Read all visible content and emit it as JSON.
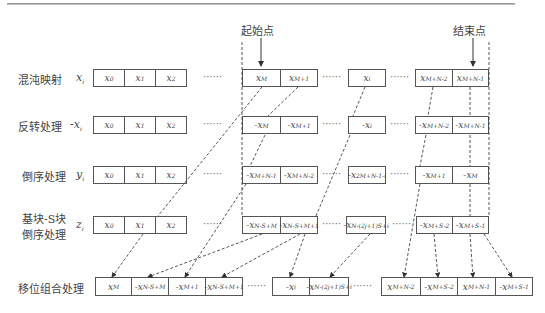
{
  "markers": {
    "start": "起始点",
    "end": "结束点"
  },
  "rows": [
    {
      "label": "混沌映射",
      "var": "x",
      "left": [
        "x₀",
        "x₁",
        "x₂"
      ],
      "right": [
        "x_M",
        "x_M+1",
        "x_i",
        "x_M+N-2",
        "x_M+N-1"
      ]
    },
    {
      "label": "反转处理",
      "var": "-x",
      "left": [
        "x₀",
        "x₁",
        "x₂"
      ],
      "right": [
        "-x_M",
        "-x_M+1",
        "-x_i",
        "-x_M+N-2",
        "-x_M+N-1"
      ]
    },
    {
      "label": "倒序处理",
      "var": "y",
      "left": [
        "x₀",
        "x₁",
        "x₂"
      ],
      "right": [
        "-x_M+N-1",
        "-x_M+N-2",
        "-x_2M+N-1-i",
        "-x_M+1",
        "-x_M"
      ]
    },
    {
      "label": "基块-S块",
      "label2": "倒序处理",
      "var": "z",
      "left": [
        "x₀",
        "x₁",
        "x₂"
      ],
      "right": [
        "-x_N-S+M",
        "-x_N-S+M+1",
        "-x_N-(2j+1)S+i",
        "-x_M+S-2",
        "-x_M+S-1"
      ]
    },
    {
      "label": "移位组合处理",
      "cells": [
        "x_M",
        "-x_N-S+M",
        "-x_M+1",
        "-x_N-S+M+1",
        "-x_i",
        "-x_N-(2j+1)S+i",
        "x_M+N-2",
        "-x_M+S-2",
        "x_M+N-1",
        "-x_M+S-1"
      ]
    }
  ],
  "cells_display": {
    "r0": [
      "x",
      "0",
      "x",
      "1",
      "x",
      "2"
    ],
    "r1l": [
      [
        "x",
        "0"
      ],
      [
        "x",
        "1"
      ],
      [
        "x",
        "2"
      ]
    ]
  },
  "dots": "······",
  "caption": "图 · 倒序与移位组合处理示意图"
}
